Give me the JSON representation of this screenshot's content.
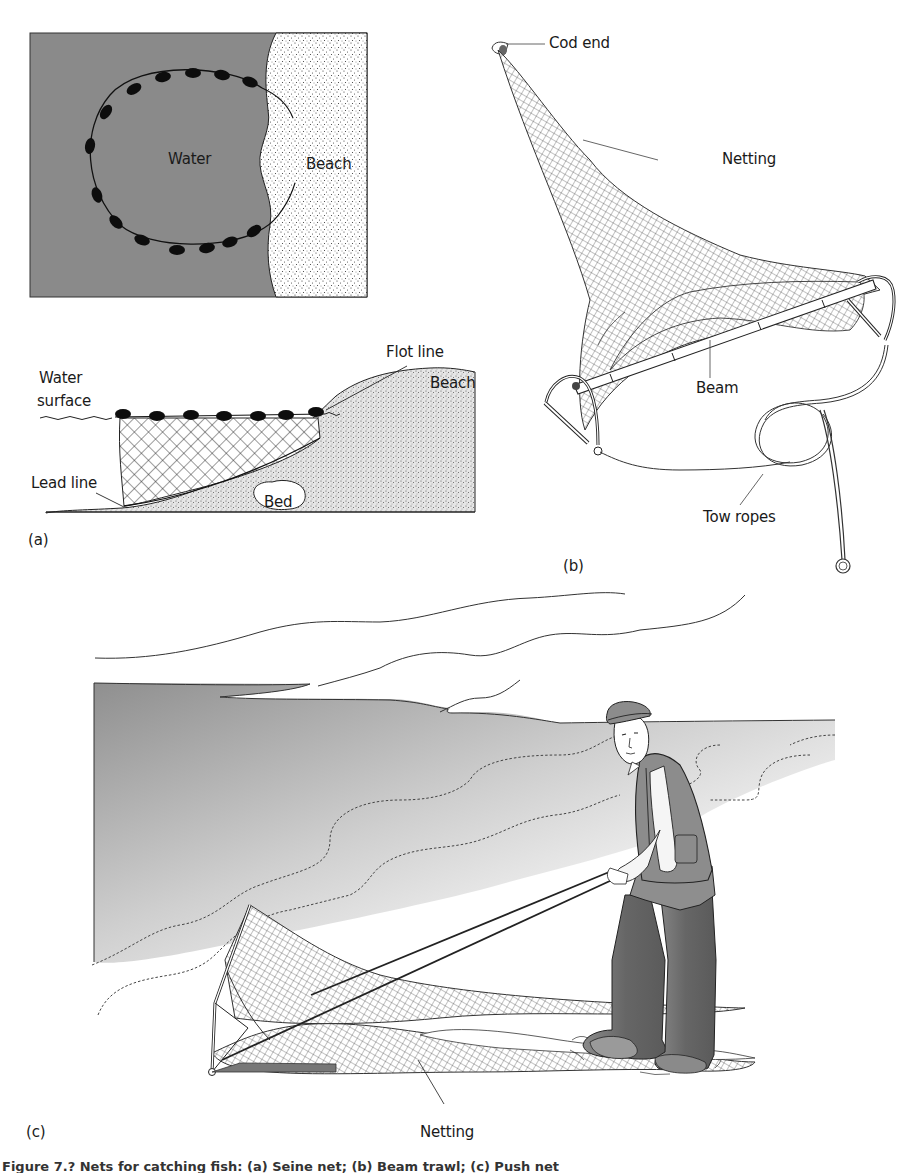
{
  "figure": {
    "caption": "Figure 7.?  Nets for catching fish: (a) Seine net; (b) Beam trawl; (c) Push net",
    "colors": {
      "water": "#8a8a8a",
      "beach_sand": "#ffffff",
      "bed_sand": "#d9d9d9",
      "ink": "#1a1a1a",
      "clothing": "#8c8c8c",
      "waders": "#6e6e6e"
    }
  },
  "panel_a": {
    "tag": "(a)",
    "plan_view": {
      "water_label": "Water",
      "beach_label": "Beach",
      "float_count": 15
    },
    "section_view": {
      "water_surface_label_line1": "Water",
      "water_surface_label_line2": "surface",
      "flot_line_label": "Flot line",
      "beach_label": "Beach",
      "lead_line_label": "Lead line",
      "bed_label": "Bed",
      "float_count": 7
    }
  },
  "panel_b": {
    "tag": "(b)",
    "labels": {
      "cod_end": "Cod end",
      "netting": "Netting",
      "beam": "Beam",
      "tow_ropes": "Tow ropes"
    }
  },
  "panel_c": {
    "tag": "(c)",
    "labels": {
      "netting": "Netting"
    }
  }
}
